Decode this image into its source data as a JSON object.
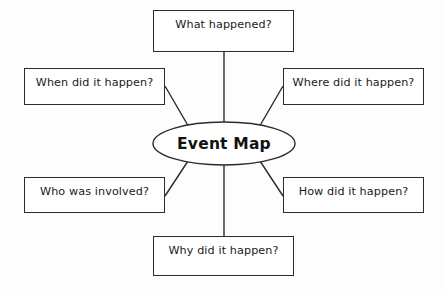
{
  "diagram": {
    "type": "concept-map",
    "title": "Event Map",
    "background_color": "#fdfdfd",
    "stroke_color": "#2b2b2b",
    "text_color": "#1a1a1a",
    "center": {
      "label": "Event Map",
      "shape": "ellipse",
      "cx": 224,
      "cy": 143.5,
      "rx": 71,
      "ry": 21.5
    },
    "nodes": [
      {
        "id": "what",
        "label": "What happened?",
        "x": 153,
        "y": 10,
        "width": 141,
        "height": 42,
        "position": "top"
      },
      {
        "id": "when",
        "label": "When did it happen?",
        "x": 24,
        "y": 68,
        "width": 141,
        "height": 37,
        "position": "top-left"
      },
      {
        "id": "where",
        "label": "Where did it happen?",
        "x": 283,
        "y": 68,
        "width": 141,
        "height": 37,
        "position": "top-right"
      },
      {
        "id": "who",
        "label": "Who was involved?",
        "x": 24,
        "y": 177,
        "width": 141,
        "height": 36,
        "position": "bottom-left"
      },
      {
        "id": "how",
        "label": "How did it happen?",
        "x": 283,
        "y": 177,
        "width": 141,
        "height": 36,
        "position": "bottom-right"
      },
      {
        "id": "why",
        "label": "Why did it happen?",
        "x": 153,
        "y": 236,
        "width": 141,
        "height": 40,
        "position": "bottom"
      }
    ],
    "connectors": [
      {
        "from": "what",
        "x1": 224,
        "y1": 52,
        "x2": 224,
        "y2": 122
      },
      {
        "from": "when",
        "x1": 165,
        "y1": 86,
        "x2": 190,
        "y2": 129
      },
      {
        "from": "where",
        "x1": 283,
        "y1": 86,
        "x2": 258,
        "y2": 129
      },
      {
        "from": "who",
        "x1": 165,
        "y1": 196,
        "x2": 190,
        "y2": 158
      },
      {
        "from": "how",
        "x1": 283,
        "y1": 196,
        "x2": 258,
        "y2": 158
      },
      {
        "from": "why",
        "x1": 224,
        "y1": 236,
        "x2": 224,
        "y2": 165
      }
    ]
  }
}
